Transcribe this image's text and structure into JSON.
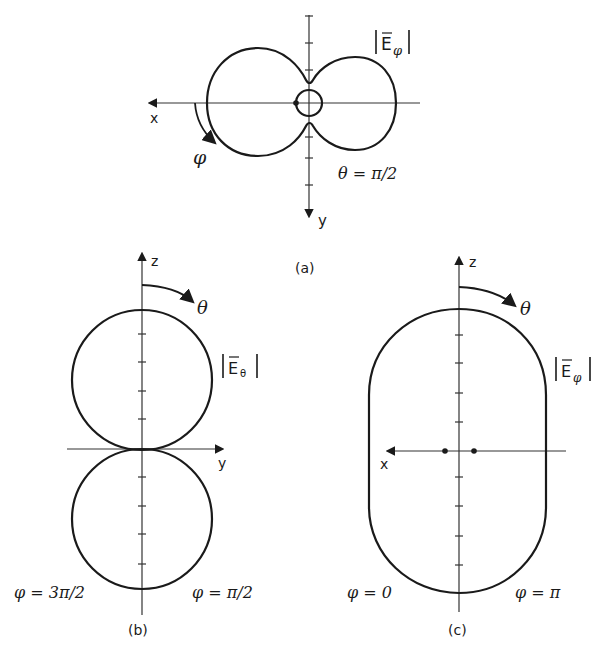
{
  "figure": {
    "panel_a": {
      "caption": "(a)",
      "axis_x": "x",
      "axis_y": "y",
      "field_label": "|Eφ|",
      "field_base": "E",
      "field_sub": "φ",
      "angle_symbol": "φ",
      "condition": "θ = π/2"
    },
    "panel_b": {
      "caption": "(b)",
      "axis_z": "z",
      "axis_y": "y",
      "field_label": "|Eθ|",
      "field_base": "E",
      "field_sub": "θ",
      "angle_symbol": "θ",
      "left_condition": "φ = 3π/2",
      "right_condition": "φ = π/2"
    },
    "panel_c": {
      "caption": "(c)",
      "axis_z": "z",
      "axis_x": "x",
      "field_label": "|Eφ|",
      "field_base": "E",
      "field_sub": "φ",
      "angle_symbol": "θ",
      "left_condition": "φ = 0",
      "right_condition": "φ = π"
    }
  }
}
